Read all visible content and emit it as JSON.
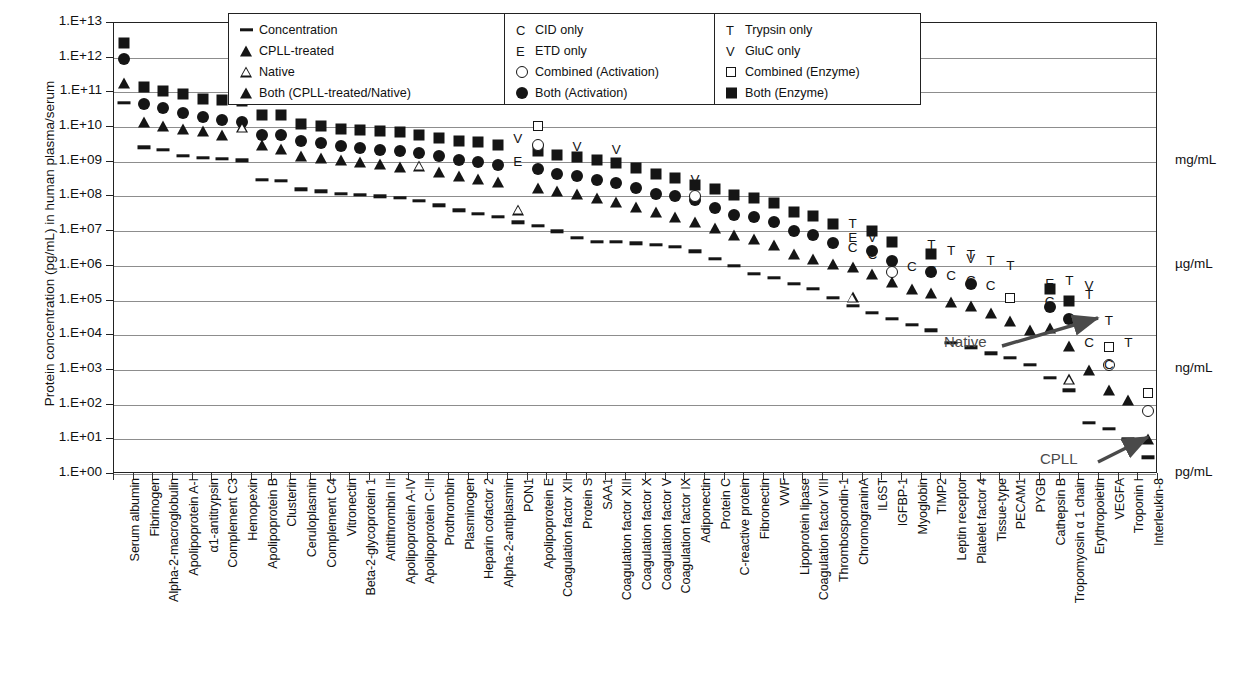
{
  "chart_data": {
    "type": "scatter",
    "title": "",
    "ylabel": "Protein concentration (pg/mL) in human plasma/serum",
    "xlabel": "",
    "ylim": [
      1,
      10000000000000.0
    ],
    "ytick_labels": [
      "1.E+13",
      "1.E+12",
      "1.E+11",
      "1.E+10",
      "1.E+09",
      "1.E+08",
      "1.E+07",
      "1.E+06",
      "1.E+05",
      "1.E+04",
      "1.E+03",
      "1.E+02",
      "1.E+01",
      "1.E+00"
    ],
    "grid": true,
    "legend_position": "top-center",
    "right_axis_units": [
      {
        "label": "mg/mL",
        "exponent": 9
      },
      {
        "label": "µg/mL",
        "exponent": 6
      },
      {
        "label": "ng/mL",
        "exponent": 3
      },
      {
        "label": "pg/mL",
        "exponent": 0
      }
    ],
    "annotations": [
      {
        "text": "Native",
        "x_px": 1005,
        "y_px": 343
      },
      {
        "text": "CPLL",
        "x_px": 1055,
        "y_px": 460
      }
    ],
    "categories": [
      "Serum albumin",
      "Fibrinogen",
      "Alpha-2-macroglobulin",
      "Apolipoprotein A-I",
      "α1-antitrypsin",
      "Complement C3",
      "Hemopexin",
      "Apolipoprotein B",
      "Clusterin",
      "Ceruloplasmin",
      "Complement C4",
      "Vitronectin",
      "Beta-2-glycoprotein 1",
      "Antithrombin III",
      "Apolipoprotein A-IV",
      "Apolipoprotein C-III",
      "Prothrombin",
      "Plasminogen",
      "Heparin cofactor 2",
      "Alpha-2-antiplasmin",
      "PON1",
      "Apolipoprotein E",
      "Coagulation factor XII",
      "Protein S",
      "SAA1",
      "Coagulation factor XIII",
      "Coagulation factor X",
      "Coagulation factor V",
      "Coagulation factor IX",
      "Adiponectin",
      "Protein C",
      "C-reactive protein",
      "Fibronectin",
      "VWF",
      "Lipoprotein lipase",
      "Coagulation factor VIII",
      "Thrombospondin-1",
      "ChromograninA",
      "IL6ST",
      "IGFBP-1",
      "Myoglobin",
      "TIMP2",
      "Leptin receptor",
      "Platelet factor 4",
      "Tissue-type",
      "PECAM1",
      "PYGB",
      "Cathepsin B",
      "Tropomyosin α 1 chain",
      "Erythropoietin",
      "VEGFA",
      "Troponin I",
      "Interleukin-8"
    ],
    "series": [
      {
        "name": "Both (Enzyme)",
        "marker": "square-filled",
        "values": [
          2600000000000.0,
          140000000000.0,
          110000000000.0,
          90000000000.0,
          65000000000.0,
          60000000000.0,
          55000000000.0,
          22000000000.0,
          22000000000.0,
          12000000000.0,
          11000000000.0,
          9000000000.0,
          8000000000.0,
          7500000000.0,
          7000000000.0,
          6000000000.0,
          5000000000.0,
          4000000000.0,
          3600000000.0,
          3000000000.0,
          null,
          2000000000.0,
          1600000000.0,
          1400000000.0,
          1100000000.0,
          900000000.0,
          650000000.0,
          450000000.0,
          350000000.0,
          220000000.0,
          160000000.0,
          110000000.0,
          90000000.0,
          65000000.0,
          35000000.0,
          28000000.0,
          16000000.0,
          null,
          10000000.0,
          5000000.0,
          null,
          2200000.0,
          null,
          null,
          null,
          null,
          null,
          220000.0,
          100000.0,
          null,
          null,
          null,
          null
        ]
      },
      {
        "name": "Both (Activation)",
        "marker": "circle-filled",
        "values": [
          900000000000.0,
          45000000000.0,
          36000000000.0,
          26000000000.0,
          20000000000.0,
          16000000000.0,
          14000000000.0,
          6000000000.0,
          6000000000.0,
          4000000000.0,
          3500000000.0,
          2800000000.0,
          2500000000.0,
          2200000000.0,
          2000000000.0,
          1800000000.0,
          1500000000.0,
          1100000000.0,
          1000000000.0,
          800000000.0,
          null,
          600000000.0,
          450000000.0,
          400000000.0,
          300000000.0,
          250000000.0,
          180000000.0,
          120000000.0,
          100000000.0,
          80000000.0,
          45000000.0,
          30000000.0,
          25000000.0,
          18000000.0,
          10000000.0,
          7500000.0,
          4500000.0,
          null,
          2600000.0,
          1400000.0,
          null,
          650000.0,
          null,
          300000.0,
          null,
          null,
          null,
          65000.0,
          30000.0,
          null,
          null,
          null,
          null
        ]
      },
      {
        "name": "Both (CPLL-treated/Native)",
        "marker": "triangle-filled",
        "values": [
          190000000000.0,
          14000000000.0,
          11000000000.0,
          9000000000.0,
          7500000000.0,
          6000000000.0,
          null,
          3000000000.0,
          2400000000.0,
          1500000000.0,
          1300000000.0,
          1100000000.0,
          1000000000.0,
          850000000.0,
          700000000.0,
          null,
          500000000.0,
          400000000.0,
          320000000.0,
          260000000.0,
          null,
          180000000.0,
          140000000.0,
          120000000.0,
          90000000.0,
          70000000.0,
          50000000.0,
          35000000.0,
          26000000.0,
          18000000.0,
          12000000.0,
          8000000.0,
          6000000.0,
          4000000.0,
          2200000.0,
          1600000.0,
          1100000.0,
          900000.0,
          600000.0,
          350000.0,
          220000.0,
          160000.0,
          90000.0,
          70000.0,
          45000.0,
          26000.0,
          14000.0,
          16000.0,
          5000.0,
          1000.0,
          260.0,
          140.0,
          10.0
        ]
      },
      {
        "name": "Native",
        "marker": "triangle-open",
        "values": [
          null,
          null,
          null,
          null,
          null,
          null,
          10000000000.0,
          null,
          null,
          null,
          null,
          null,
          null,
          null,
          null,
          1600000000.0,
          null,
          null,
          null,
          null,
          180000000.0,
          null,
          null,
          null,
          null,
          null,
          null,
          null,
          null,
          null,
          null,
          null,
          null,
          null,
          null,
          null,
          null,
          1100000.0,
          null,
          null,
          null,
          null,
          null,
          null,
          null,
          null,
          null,
          null,
          10000.0,
          null,
          null,
          null,
          null
        ]
      },
      {
        "name": "Concentration",
        "marker": "dash",
        "values": [
          50000000000.0,
          2600000000.0,
          2200000000.0,
          1500000000.0,
          1300000000.0,
          1200000000.0,
          1100000000.0,
          300000000.0,
          280000000.0,
          160000000.0,
          140000000.0,
          120000000.0,
          110000000.0,
          100000000.0,
          90000000.0,
          75000000.0,
          55000000.0,
          40000000.0,
          32000000.0,
          26000000.0,
          18000000.0,
          14000000.0,
          10000000.0,
          6500000.0,
          5000000.0,
          5000000.0,
          4500000.0,
          4000000.0,
          3600000.0,
          2600000.0,
          1600000.0,
          1000000.0,
          600000.0,
          450000.0,
          300000.0,
          220000.0,
          120000.0,
          70000.0,
          45000.0,
          30000.0,
          20000.0,
          14000.0,
          6000.0,
          4500.0,
          3000.0,
          2200.0,
          1400.0,
          600.0,
          260.0,
          30.0,
          20.0,
          10.0,
          3.0
        ]
      },
      {
        "name": "Combined (Enzyme)",
        "marker": "square-open",
        "values": [
          null,
          null,
          null,
          null,
          null,
          null,
          null,
          null,
          null,
          null,
          null,
          null,
          null,
          null,
          null,
          null,
          null,
          null,
          null,
          null,
          null,
          11000000000.0,
          null,
          null,
          null,
          null,
          null,
          null,
          null,
          null,
          null,
          null,
          null,
          null,
          null,
          null,
          null,
          null,
          null,
          null,
          null,
          null,
          null,
          null,
          null,
          120000.0,
          null,
          null,
          null,
          null,
          4500.0,
          null,
          220.0
        ]
      },
      {
        "name": "Combined (Activation)",
        "marker": "circle-open",
        "values": [
          null,
          null,
          null,
          null,
          null,
          null,
          null,
          null,
          null,
          null,
          null,
          null,
          null,
          null,
          null,
          null,
          null,
          null,
          null,
          null,
          null,
          3000000000.0,
          null,
          null,
          null,
          null,
          null,
          null,
          null,
          100000000.0,
          null,
          null,
          null,
          null,
          null,
          null,
          null,
          null,
          null,
          650000.0,
          null,
          null,
          null,
          null,
          null,
          null,
          null,
          null,
          null,
          null,
          1400.0,
          null,
          65.0
        ]
      },
      {
        "name": "CID only",
        "marker": "letter-C",
        "values": [
          null,
          null,
          null,
          null,
          null,
          null,
          null,
          null,
          null,
          null,
          null,
          null,
          null,
          null,
          null,
          null,
          null,
          null,
          null,
          null,
          null,
          null,
          null,
          null,
          null,
          null,
          null,
          null,
          null,
          null,
          null,
          null,
          null,
          null,
          null,
          null,
          null,
          3200000.0,
          2000000.0,
          1400000.0,
          900000.0,
          700000.0,
          500000.0,
          360000.0,
          260000.0,
          null,
          null,
          90000.0,
          30000.0,
          6000.0,
          1400.0,
          null,
          null
        ]
      },
      {
        "name": "ETD only",
        "marker": "letter-E",
        "values": [
          null,
          null,
          null,
          null,
          null,
          null,
          null,
          null,
          null,
          null,
          null,
          null,
          null,
          null,
          null,
          null,
          null,
          null,
          null,
          null,
          1000000000.0,
          null,
          null,
          null,
          null,
          null,
          null,
          null,
          null,
          null,
          null,
          null,
          null,
          null,
          null,
          null,
          null,
          6500000.0,
          null,
          null,
          null,
          null,
          null,
          null,
          null,
          null,
          null,
          300000.0,
          null,
          null,
          null,
          null,
          null
        ]
      },
      {
        "name": "Trypsin only",
        "marker": "letter-T",
        "values": [
          null,
          null,
          null,
          null,
          null,
          null,
          null,
          null,
          null,
          null,
          null,
          null,
          null,
          null,
          null,
          null,
          null,
          null,
          null,
          null,
          null,
          null,
          null,
          null,
          null,
          null,
          null,
          null,
          null,
          null,
          null,
          null,
          null,
          null,
          null,
          null,
          null,
          16000000.0,
          10000000.0,
          null,
          null,
          4000000.0,
          2600000.0,
          2000000.0,
          1400000.0,
          1000000.0,
          null,
          null,
          360000.0,
          140000.0,
          26000.0,
          6000.0,
          null
        ]
      },
      {
        "name": "GluC only",
        "marker": "letter-V",
        "values": [
          null,
          null,
          null,
          null,
          null,
          null,
          null,
          null,
          null,
          null,
          null,
          null,
          null,
          null,
          null,
          null,
          null,
          null,
          null,
          null,
          4500000000.0,
          null,
          null,
          2600000000.0,
          null,
          2200000000.0,
          null,
          null,
          null,
          300000000.0,
          null,
          null,
          null,
          null,
          null,
          null,
          null,
          null,
          6500000.0,
          4500000.0,
          null,
          null,
          null,
          1600000.0,
          null,
          null,
          null,
          null,
          null,
          260000.0,
          null,
          null,
          null
        ]
      }
    ]
  },
  "legend": {
    "columns": [
      {
        "id": "col-shapes",
        "items": [
          {
            "symbol": "dash",
            "label": "Concentration"
          },
          {
            "symbol": "triangle-filled",
            "label": "CPLL-treated"
          },
          {
            "symbol": "triangle-open",
            "label": "Native"
          },
          {
            "symbol": "triangle-filled",
            "label": "Both (CPLL-treated/Native)"
          }
        ]
      },
      {
        "id": "col-activation",
        "items": [
          {
            "symbol": "letter-C",
            "label": "CID only"
          },
          {
            "symbol": "letter-E",
            "label": "ETD only"
          },
          {
            "symbol": "circle-open",
            "label": "Combined (Activation)"
          },
          {
            "symbol": "circle-filled",
            "label": "Both (Activation)"
          }
        ]
      },
      {
        "id": "col-enzyme",
        "items": [
          {
            "symbol": "letter-T",
            "label": "Trypsin only"
          },
          {
            "symbol": "letter-V",
            "label": "GluC only"
          },
          {
            "symbol": "square-open",
            "label": "Combined (Enzyme)"
          },
          {
            "symbol": "square-filled",
            "label": "Both (Enzyme)"
          }
        ]
      }
    ]
  },
  "colors": {
    "marker": "#151515",
    "gridline": "#8d8d8d",
    "axis": "#222222",
    "annotation": "#4a4a4a"
  }
}
